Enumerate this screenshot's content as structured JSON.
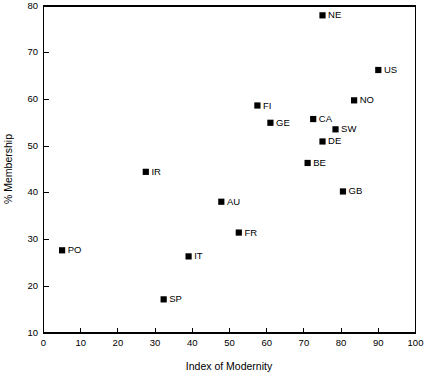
{
  "chart_data": {
    "type": "scatter",
    "title": "",
    "xlabel": "Index of Modernity",
    "ylabel": "% Membership",
    "xlim": [
      0,
      100
    ],
    "ylim": [
      10,
      80
    ],
    "xticks": [
      0,
      10,
      20,
      30,
      40,
      50,
      60,
      70,
      80,
      90,
      100
    ],
    "yticks": [
      10,
      20,
      30,
      40,
      50,
      60,
      70,
      80
    ],
    "xtick_labels": [
      "0",
      "10",
      "20",
      "30",
      "40",
      "50",
      "60",
      "70",
      "80",
      "90",
      "100"
    ],
    "ytick_labels": [
      "10",
      "20",
      "30",
      "40",
      "50",
      "60",
      "70",
      "80"
    ],
    "grid": false,
    "legend": "none",
    "marker_style": "filled-square",
    "marker_color": "#000000",
    "points": [
      {
        "label": "NE",
        "x": 75.0,
        "y": 78.0,
        "label_side": "right"
      },
      {
        "label": "US",
        "x": 90.0,
        "y": 66.3,
        "label_side": "right"
      },
      {
        "label": "NO",
        "x": 83.5,
        "y": 59.8,
        "label_side": "right"
      },
      {
        "label": "FI",
        "x": 57.5,
        "y": 58.7,
        "label_side": "right"
      },
      {
        "label": "CA",
        "x": 72.5,
        "y": 55.8,
        "label_side": "right"
      },
      {
        "label": "GE",
        "x": 61.0,
        "y": 55.0,
        "label_side": "right"
      },
      {
        "label": "SW",
        "x": 78.5,
        "y": 53.6,
        "label_side": "right"
      },
      {
        "label": "DE",
        "x": 75.0,
        "y": 51.0,
        "label_side": "right"
      },
      {
        "label": "BE",
        "x": 71.0,
        "y": 46.4,
        "label_side": "right"
      },
      {
        "label": "IR",
        "x": 27.5,
        "y": 44.5,
        "label_side": "right"
      },
      {
        "label": "GB",
        "x": 80.5,
        "y": 40.3,
        "label_side": "right"
      },
      {
        "label": "AU",
        "x": 47.8,
        "y": 38.1,
        "label_side": "right"
      },
      {
        "label": "FR",
        "x": 52.5,
        "y": 31.5,
        "label_side": "right"
      },
      {
        "label": "PO",
        "x": 5.0,
        "y": 27.7,
        "label_side": "right"
      },
      {
        "label": "IT",
        "x": 39.0,
        "y": 26.4,
        "label_side": "right"
      },
      {
        "label": "SP",
        "x": 32.3,
        "y": 17.2,
        "label_side": "right"
      }
    ]
  }
}
